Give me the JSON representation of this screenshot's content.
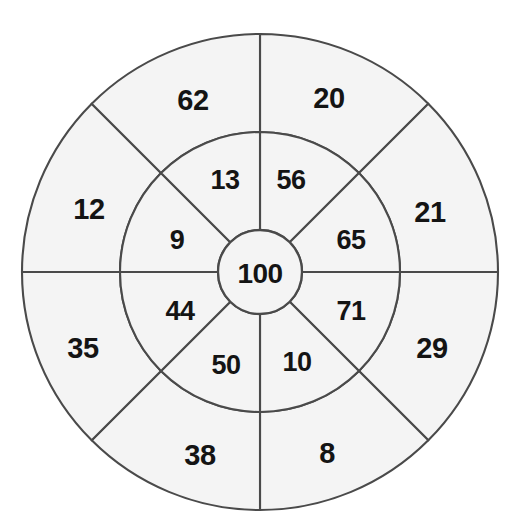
{
  "figure": {
    "kind": "concentric-ring-number-wheel",
    "background_color": "#ffffff",
    "sector_fill_color": "#f4f4f4",
    "stroke_color": "#4a4a4a",
    "label_color": "#141414",
    "center_x": 260,
    "center_y": 272,
    "outer_radius": 238,
    "middle_radius": 140,
    "center_radius": 42
  },
  "center": {
    "value": "100"
  },
  "middle_ring": {
    "values": [
      {
        "value": "56",
        "angle_deg": 292.5,
        "label_x": 291,
        "label_y": 180
      },
      {
        "value": "65",
        "angle_deg": 337.5,
        "label_x": 351,
        "label_y": 240
      },
      {
        "value": "71",
        "angle_deg": 22.5,
        "label_x": 351,
        "label_y": 311
      },
      {
        "value": "10",
        "angle_deg": 67.5,
        "label_x": 297,
        "label_y": 362
      },
      {
        "value": "50",
        "angle_deg": 112.5,
        "label_x": 226,
        "label_y": 365
      },
      {
        "value": "44",
        "angle_deg": 157.5,
        "label_x": 180,
        "label_y": 311
      },
      {
        "value": "9",
        "angle_deg": 202.5,
        "label_x": 177,
        "label_y": 240
      },
      {
        "value": "13",
        "angle_deg": 247.5,
        "label_x": 225,
        "label_y": 180
      }
    ]
  },
  "outer_ring": {
    "values": [
      {
        "value": "20",
        "angle_deg": 292.5,
        "label_x": 329,
        "label_y": 98
      },
      {
        "value": "21",
        "angle_deg": 337.5,
        "label_x": 430,
        "label_y": 212
      },
      {
        "value": "29",
        "angle_deg": 22.5,
        "label_x": 432,
        "label_y": 348
      },
      {
        "value": "8",
        "angle_deg": 67.5,
        "label_x": 327,
        "label_y": 453
      },
      {
        "value": "38",
        "angle_deg": 112.5,
        "label_x": 200,
        "label_y": 455
      },
      {
        "value": "35",
        "angle_deg": 157.5,
        "label_x": 83,
        "label_y": 348
      },
      {
        "value": "12",
        "angle_deg": 202.5,
        "label_x": 89,
        "label_y": 209
      },
      {
        "value": "62",
        "angle_deg": 247.5,
        "label_x": 193,
        "label_y": 100
      }
    ]
  }
}
